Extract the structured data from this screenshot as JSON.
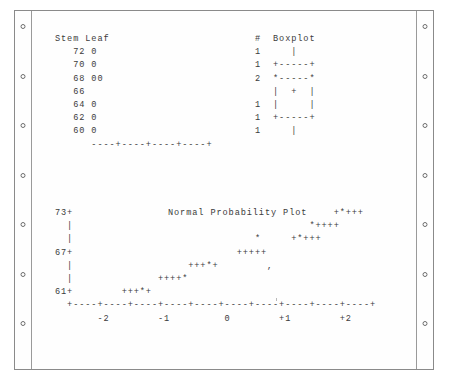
{
  "page": {
    "media": "continuous-feed tractor paper",
    "hole_count_per_side": 7
  },
  "stemleaf": {
    "header": "Stem Leaf                         #  Boxplot",
    "rows": [
      {
        "stem": "72",
        "leaf": "0",
        "count": "1",
        "box": "   |"
      },
      {
        "stem": "70",
        "leaf": "0",
        "count": "1",
        "box": "+-----+"
      },
      {
        "stem": "68",
        "leaf": "00",
        "count": "2",
        "box": "*-----*"
      },
      {
        "stem": "66",
        "leaf": "",
        "count": "",
        "box": "|  +  |"
      },
      {
        "stem": "64",
        "leaf": "0",
        "count": "1",
        "box": "|     |"
      },
      {
        "stem": "62",
        "leaf": "0",
        "count": "1",
        "box": "+-----+"
      },
      {
        "stem": "60",
        "leaf": "0",
        "count": "1",
        "box": "   |"
      }
    ],
    "axis": "         ----+----+----+----+",
    "text": "Stem Leaf                        #  Boxplot\n   72 0                          1     |\n   70 0                          1  +-----+\n   68 00                         2  *-----*\n   66                               |  +  |\n   64 0                          1  |     |\n   62 0                          1  +-----+\n   60 0                          1     |\n      ----+----+----+----+"
  },
  "npp": {
    "title": "Normal Probability Plot",
    "y_ticks": [
      "73+",
      "|",
      "|",
      "67+",
      "|",
      "|",
      "61+"
    ],
    "x_ticks": [
      "-2",
      "-1",
      "0",
      "+1",
      "+2"
    ],
    "x_axis": "+----+----+----+----+----+----+----+----+----+----+",
    "x_tick_labels_line": "       -2        -1         0        +1        +2",
    "plot_rows": [
      "73+                                           +*+++",
      "  |                                       *++++",
      "  |                              *     +*+++",
      "67+                           +++++",
      "  |                   +++*+        ,",
      "  |              ++++*",
      "61+        +++*+"
    ],
    "text": "73+                                           +*+++\n  |                                       *++++\n  |                              *     +*+++\n67+                           +++++\n  |                   +++*+        ,\n  |              ++++*\n61+        +++*+\n  +----+----+----+----+----+----+----+----+----+----+\n       -2        -1         0        +1        +2"
  },
  "colors": {
    "ink": "#3b3b3b",
    "paper": "#fefefe",
    "page_border": "#8a8a8a",
    "perforation": "#9a9a9a",
    "hole_ring": "#6d6d6d"
  }
}
